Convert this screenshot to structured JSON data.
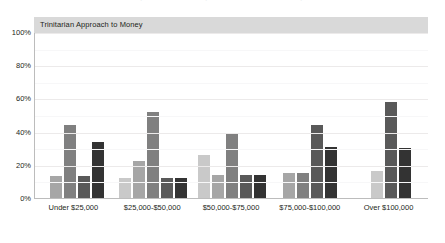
{
  "chart_data": {
    "type": "bar",
    "title": "Trinitarian Approach to Money",
    "xlabel": "",
    "ylabel": "",
    "ylim": [
      0,
      100
    ],
    "yticks": [
      "0%",
      "20%",
      "40%",
      "60%",
      "80%",
      "100%"
    ],
    "ytick_values": [
      0,
      20,
      40,
      60,
      80,
      100
    ],
    "grid": true,
    "legend": "none",
    "categories": [
      "Under $25,000",
      "$25,000-$50,000",
      "$50,000-$75,000",
      "$75,000-$100,000",
      "Over $100,000"
    ],
    "series": [
      {
        "name": "series-1",
        "color": "#c9c9c9",
        "values": [
          null,
          12,
          26,
          null,
          16
        ]
      },
      {
        "name": "series-2",
        "color": "#a6a6a6",
        "values": [
          13,
          22,
          14,
          15,
          null
        ]
      },
      {
        "name": "series-3",
        "color": "#808080",
        "values": [
          44,
          52,
          39,
          15,
          null
        ]
      },
      {
        "name": "series-4",
        "color": "#595959",
        "values": [
          13,
          12,
          14,
          44,
          58
        ]
      },
      {
        "name": "series-5",
        "color": "#333333",
        "values": [
          34,
          12,
          14,
          31,
          30
        ]
      }
    ],
    "groups": [
      {
        "label": "Under $25,000",
        "bars": [
          {
            "value": 13,
            "color": "#a6a6a6"
          },
          {
            "value": 44,
            "color": "#808080"
          },
          {
            "value": 13,
            "color": "#595959"
          },
          {
            "value": 34,
            "color": "#333333"
          }
        ]
      },
      {
        "label": "$25,000-$50,000",
        "bars": [
          {
            "value": 12,
            "color": "#c9c9c9"
          },
          {
            "value": 22,
            "color": "#a6a6a6"
          },
          {
            "value": 52,
            "color": "#808080"
          },
          {
            "value": 12,
            "color": "#595959"
          },
          {
            "value": 12,
            "color": "#333333"
          }
        ]
      },
      {
        "label": "$50,000-$75,000",
        "bars": [
          {
            "value": 26,
            "color": "#c9c9c9"
          },
          {
            "value": 14,
            "color": "#a6a6a6"
          },
          {
            "value": 39,
            "color": "#808080"
          },
          {
            "value": 14,
            "color": "#595959"
          },
          {
            "value": 14,
            "color": "#333333"
          }
        ]
      },
      {
        "label": "$75,000-$100,000",
        "bars": [
          {
            "value": 15,
            "color": "#a6a6a6"
          },
          {
            "value": 15,
            "color": "#808080"
          },
          {
            "value": 44,
            "color": "#595959"
          },
          {
            "value": 31,
            "color": "#333333"
          }
        ]
      },
      {
        "label": "Over $100,000",
        "bars": [
          {
            "value": 16,
            "color": "#c9c9c9"
          },
          {
            "value": 58,
            "color": "#595959"
          },
          {
            "value": 30,
            "color": "#333333"
          }
        ]
      }
    ]
  },
  "style": {
    "title_band_color": "#d9d9d9",
    "grid_color": "#f0f0f2",
    "axis_color": "#bcbcbc",
    "text_color": "#231f20",
    "background": "#ffffff"
  }
}
